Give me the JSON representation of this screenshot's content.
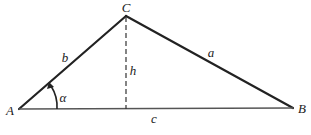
{
  "diagram": {
    "type": "triangle",
    "vertices": {
      "A": {
        "label": "A",
        "x": 19,
        "y": 109
      },
      "B": {
        "label": "B",
        "x": 293,
        "y": 108
      },
      "C": {
        "label": "C",
        "x": 126,
        "y": 16
      }
    },
    "sides": {
      "a": {
        "label": "a",
        "from": "C",
        "to": "B"
      },
      "b": {
        "label": "b",
        "from": "A",
        "to": "C"
      },
      "c": {
        "label": "c",
        "from": "A",
        "to": "B"
      }
    },
    "altitude": {
      "label": "h",
      "from": "C",
      "foot_x": 126,
      "style": "dashed"
    },
    "angle": {
      "label": "α",
      "vertex": "A"
    },
    "colors": {
      "stroke": "#222222",
      "base": "#555555",
      "background": "#ffffff"
    }
  }
}
